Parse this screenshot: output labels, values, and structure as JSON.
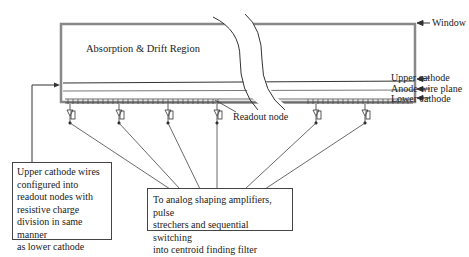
{
  "diagram": {
    "region_label": "Absorption & Drift Region",
    "labels": {
      "window": "Window",
      "upper_cathode": "Upper cathode",
      "anode_wire_plane": "Anode wire plane",
      "lower_cathode": "Lower cathode",
      "readout_node": "Readout node"
    },
    "notes": {
      "left_box": [
        "Upper cathode wires",
        "configured into",
        "readout nodes with",
        "resistive charge",
        "division in same manner",
        "as lower cathode"
      ],
      "bottom_box": [
        "To analog shaping amplifiers, pulse",
        "strechers and sequential switching",
        "into centroid finding filter"
      ]
    },
    "colors": {
      "line": "#333333",
      "frame": "#777777",
      "background": "#ffffff"
    }
  }
}
